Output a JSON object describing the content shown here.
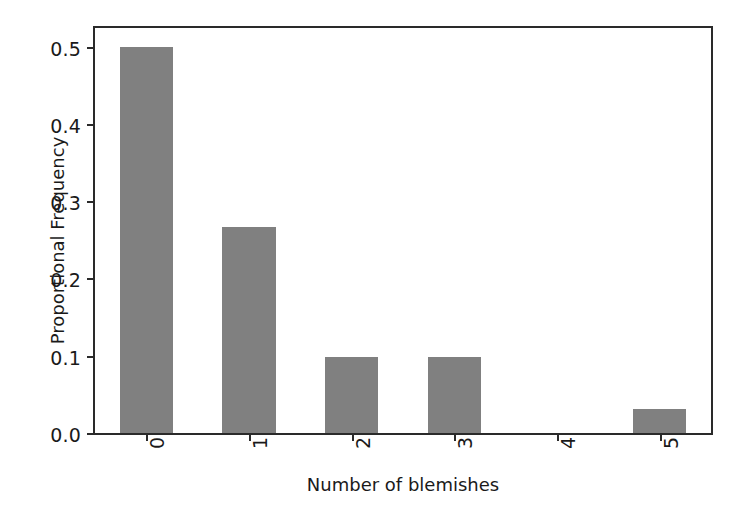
{
  "chart_data": {
    "type": "bar",
    "title": "",
    "xlabel": "Number of blemishes",
    "ylabel": "Proportional Frequency",
    "categories": [
      "0",
      "1",
      "2",
      "3",
      "4",
      "5"
    ],
    "values": [
      0.5,
      0.267,
      0.098,
      0.098,
      0.0,
      0.031
    ],
    "series": [
      {
        "name": "Proportional Frequency",
        "values": [
          0.5,
          0.267,
          0.098,
          0.098,
          0.0,
          0.031
        ]
      }
    ],
    "ylim": [
      0.0,
      0.524
    ],
    "xlim": [
      -0.5,
      5.5
    ],
    "ytick_labels": [
      "0.0",
      "0.1",
      "0.2",
      "0.3",
      "0.4",
      "0.5"
    ],
    "ytick_values": [
      0.0,
      0.1,
      0.2,
      0.3,
      0.4,
      0.5
    ],
    "xtick_labels": [
      "0",
      "1",
      "2",
      "3",
      "4",
      "5"
    ],
    "xtick_label_rotation": 90,
    "grid": false,
    "legend": false,
    "bar_color": "#808080",
    "axis_color": "#2a2a2a",
    "background_color": "#ffffff",
    "bar_width_fraction": 0.52
  }
}
